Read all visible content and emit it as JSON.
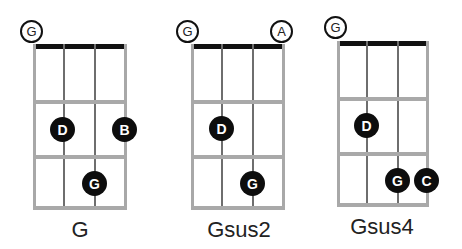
{
  "chords": [
    {
      "name": "G",
      "open_strings": [
        "G"
      ],
      "fingered": [
        {
          "note": "D",
          "string": 2,
          "fret": 2
        },
        {
          "note": "B",
          "string": 4,
          "fret": 2
        },
        {
          "note": "G",
          "string": 3,
          "fret": 3
        }
      ]
    },
    {
      "name": "Gsus2",
      "open_strings": [
        "G",
        "A"
      ],
      "fingered": [
        {
          "note": "D",
          "string": 2,
          "fret": 2
        },
        {
          "note": "G",
          "string": 3,
          "fret": 3
        }
      ]
    },
    {
      "name": "Gsus4",
      "open_strings": [
        "G"
      ],
      "fingered": [
        {
          "note": "D",
          "string": 2,
          "fret": 2
        },
        {
          "note": "G",
          "string": 3,
          "fret": 3
        },
        {
          "note": "C",
          "string": 4,
          "fret": 3
        }
      ]
    }
  ],
  "colors": {
    "dot": "#0d0d0d",
    "nut": "#111111",
    "fret": "#a9a9a9",
    "string": "#6e6e6e"
  }
}
